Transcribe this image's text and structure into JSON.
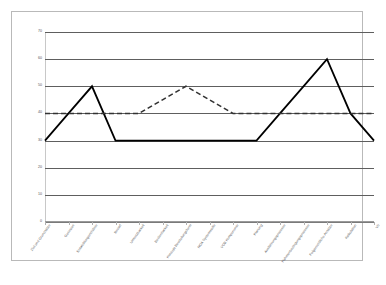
{
  "chart_data": {
    "type": "line",
    "title": "",
    "xlabel": "",
    "ylabel": "",
    "ylim": [
      0,
      70
    ],
    "ytick_step": 10,
    "yticks": [
      0,
      10,
      20,
      30,
      40,
      50,
      60,
      70
    ],
    "grid": true,
    "legend": "none",
    "categories": [
      "Ziel und Grundsätze",
      "Gesetzes",
      "Entwicklungsrichtlinie",
      "Bedarf",
      "Umsetzbarkeit",
      "Bedienbarkeit",
      "Konzept Beurteilungsform",
      "NOA Systemstelle",
      "VOB Komponente",
      "Planung",
      "Ausführungsprozesse",
      "Rahmenbedingungsprozesse",
      "Folgerechtliche Ansätze",
      "Kalkulation",
      "Vb"
    ],
    "series": [
      {
        "name": "Ist-Zustand",
        "style": "solid",
        "color": "#000000",
        "values": [
          30,
          40,
          50,
          30,
          30,
          30,
          30,
          30,
          30,
          30,
          40,
          50,
          60,
          40,
          30
        ]
      },
      {
        "name": "Soll-Zustand",
        "style": "dashed",
        "color": "#333333",
        "values": [
          40,
          40,
          40,
          40,
          40,
          45,
          50,
          45,
          40,
          40,
          40,
          40,
          40,
          40,
          40
        ]
      }
    ]
  },
  "caption": ""
}
